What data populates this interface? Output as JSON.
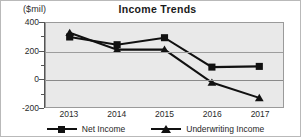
{
  "chart_data": {
    "type": "line",
    "title": "Income Trends",
    "unit_label": "($mil)",
    "xlabel": "",
    "ylabel": "",
    "categories": [
      "2013",
      "2014",
      "2015",
      "2016",
      "2017"
    ],
    "series": [
      {
        "name": "Underwriting Income",
        "marker": "triangle",
        "color": "#111111",
        "values": [
          330,
          210,
          210,
          -25,
          -135
        ]
      },
      {
        "name": "Net Income",
        "marker": "square",
        "color": "#111111",
        "values": [
          300,
          245,
          295,
          85,
          90
        ]
      }
    ],
    "ylim": [
      -200,
      400
    ],
    "yticks": [
      400,
      200,
      0,
      -200
    ],
    "ytick_labels": [
      "400",
      "200",
      "0",
      "-200"
    ],
    "yticks_minor": [
      300,
      100,
      -100
    ],
    "grid": true,
    "legend_position": "bottom",
    "plot_background": "#e9e9e9",
    "frame_color": "#b9b9b9"
  },
  "legend": {
    "items": [
      {
        "label": "Underwriting Income"
      },
      {
        "label": "Net Income"
      }
    ]
  }
}
